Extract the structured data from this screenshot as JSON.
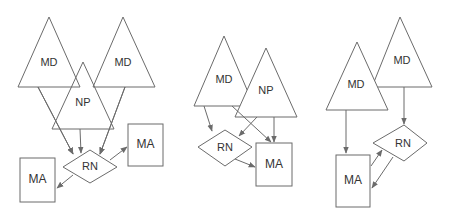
{
  "colors": {
    "stroke": "#6b6b6b",
    "text": "#333333",
    "background": "#ffffff"
  },
  "panels": [
    {
      "id": "panel-1",
      "nodes": {
        "md_left": {
          "label": "MD",
          "shape": "triangle"
        },
        "md_right": {
          "label": "MD",
          "shape": "triangle"
        },
        "np": {
          "label": "NP",
          "shape": "triangle"
        },
        "rn": {
          "label": "RN",
          "shape": "diamond"
        },
        "ma_left": {
          "label": "MA",
          "shape": "box"
        },
        "ma_right": {
          "label": "MA",
          "shape": "box"
        }
      },
      "edges": [
        {
          "from": "md_left",
          "to": "rn"
        },
        {
          "from": "np",
          "to": "rn"
        },
        {
          "from": "md_right",
          "to": "rn"
        },
        {
          "from": "rn",
          "to": "ma_left"
        },
        {
          "from": "rn",
          "to": "ma_right"
        }
      ]
    },
    {
      "id": "panel-2",
      "nodes": {
        "md": {
          "label": "MD",
          "shape": "triangle"
        },
        "np": {
          "label": "NP",
          "shape": "triangle"
        },
        "rn": {
          "label": "RN",
          "shape": "diamond"
        },
        "ma": {
          "label": "MA",
          "shape": "box"
        }
      },
      "edges": [
        {
          "from": "md",
          "to": "rn"
        },
        {
          "from": "md",
          "to": "ma"
        },
        {
          "from": "np",
          "to": "rn"
        },
        {
          "from": "np",
          "to": "ma"
        },
        {
          "from": "rn",
          "to": "ma"
        }
      ]
    },
    {
      "id": "panel-3",
      "nodes": {
        "md_left": {
          "label": "MD",
          "shape": "triangle"
        },
        "md_right": {
          "label": "MD",
          "shape": "triangle"
        },
        "rn": {
          "label": "RN",
          "shape": "diamond"
        },
        "ma": {
          "label": "MA",
          "shape": "box"
        }
      },
      "edges": [
        {
          "from": "md_left",
          "to": "ma"
        },
        {
          "from": "md_right",
          "to": "rn"
        },
        {
          "from": "ma",
          "to": "rn"
        },
        {
          "from": "rn",
          "to": "ma"
        }
      ]
    }
  ]
}
